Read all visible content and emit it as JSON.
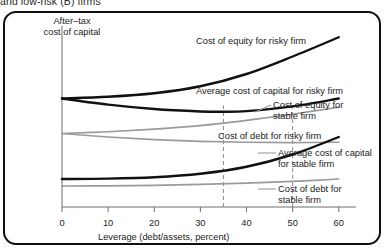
{
  "caption": {
    "text": "and low-risk (B) firms"
  },
  "chart_data": {
    "type": "line",
    "title": "",
    "xlabel": "Leverage (debt/assets, percent)",
    "ylabel": "After–tax\ncost of capital",
    "xlim": [
      0,
      62
    ],
    "ylim": [
      0,
      100
    ],
    "xticks": [
      0,
      10,
      20,
      30,
      40,
      50,
      60
    ],
    "xticklabels": [
      "0",
      "10",
      "20",
      "30",
      "40",
      "50",
      "60"
    ],
    "yticks": [],
    "grid": false,
    "legend": "annotations-on-curves",
    "reference_lines": [
      {
        "name": "optimal-leverage-risky-firm",
        "x": 35,
        "style": "dashed",
        "color": "#8c8c8c"
      },
      {
        "name": "optimal-leverage-stable-firm",
        "x": 50,
        "style": "dashed",
        "color": "#8c8c8c"
      }
    ],
    "series": [
      {
        "name": "Cost of equity for risky firm",
        "color": "#111111",
        "width": 2.4,
        "x": [
          0,
          10,
          20,
          30,
          40,
          50,
          60
        ],
        "y": [
          62,
          63,
          65,
          69,
          76,
          86,
          97
        ]
      },
      {
        "name": "Average cost of capital for risky firm",
        "color": "#111111",
        "width": 2.4,
        "x": [
          0,
          10,
          20,
          30,
          35,
          40,
          50,
          60
        ],
        "y": [
          62,
          58.5,
          56,
          54.6,
          54.4,
          54.8,
          57.5,
          62
        ]
      },
      {
        "name": "Cost of equity for stable firm",
        "color": "#9a9a9a",
        "width": 1.7,
        "x": [
          0,
          10,
          20,
          30,
          40,
          50,
          60
        ],
        "y": [
          42,
          43,
          44.5,
          46.5,
          49.5,
          53,
          57
        ]
      },
      {
        "name": "Average cost of capital for stable firm",
        "color": "#9a9a9a",
        "width": 1.7,
        "x": [
          0,
          10,
          20,
          30,
          40,
          50,
          60
        ],
        "y": [
          42,
          40,
          38.5,
          37.5,
          37,
          36.8,
          37
        ]
      },
      {
        "name": "Cost of debt for risky firm",
        "color": "#111111",
        "width": 2.4,
        "x": [
          0,
          10,
          20,
          30,
          40,
          50,
          60
        ],
        "y": [
          16,
          16.2,
          17,
          19,
          23,
          30,
          40
        ]
      },
      {
        "name": "Cost of debt for stable firm",
        "color": "#9a9a9a",
        "width": 1.7,
        "x": [
          0,
          10,
          20,
          30,
          40,
          50,
          60
        ],
        "y": [
          12,
          12.1,
          12.4,
          12.9,
          13.6,
          14.6,
          16
        ]
      }
    ],
    "annotations": [
      {
        "name": "label-cost-of-equity-risky",
        "text": "Cost of equity for risky firm",
        "left": 196,
        "top": 36,
        "leader": null
      },
      {
        "name": "label-avg-cost-capital-risky",
        "text": "Average cost of capital for risky firm",
        "left": 196,
        "top": 86,
        "leader": null
      },
      {
        "name": "label-cost-of-equity-stable",
        "text": "Cost of equity for\nstable firm",
        "left": 273,
        "top": 100,
        "leader": {
          "x1": 271,
          "y1": 105,
          "x2": 255,
          "y2": 112
        }
      },
      {
        "name": "label-cost-of-debt-risky",
        "text": "Cost of debt for risky firm",
        "left": 218,
        "top": 131,
        "leader": null
      },
      {
        "name": "label-avg-cost-capital-stable",
        "text": "Average cost of capital\nfor stable firm",
        "left": 278,
        "top": 148,
        "leader": {
          "x1": 276,
          "y1": 153,
          "x2": 258,
          "y2": 153
        }
      },
      {
        "name": "label-cost-of-debt-stable",
        "text": "Cost of debt for\nstable firm",
        "left": 278,
        "top": 184,
        "leader": {
          "x1": 276,
          "y1": 189,
          "x2": 258,
          "y2": 189
        }
      }
    ]
  }
}
